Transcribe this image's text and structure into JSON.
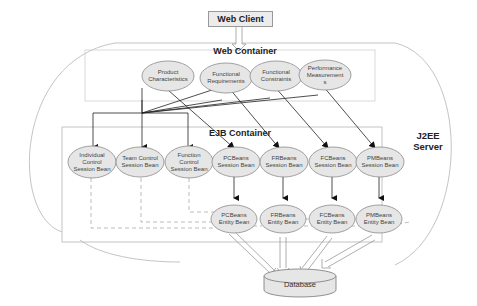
{
  "diagram": {
    "web_client": "Web Client",
    "j2ee_server": {
      "line1": "J2EE",
      "line2": "Server"
    },
    "web_container": {
      "title": "Web Container",
      "nodes": [
        {
          "line1": "Product",
          "line2": "Characteristics",
          "line3": ""
        },
        {
          "line1": "Functional",
          "line2": "Requirements",
          "line3": ""
        },
        {
          "line1": "Functional",
          "line2": "Constraints",
          "line3": ""
        },
        {
          "line1": "Performance",
          "line2": "Measurement",
          "line3": "s"
        }
      ]
    },
    "ejb_container": {
      "title": "EJB Container",
      "session_beans": [
        {
          "line1": "Individual",
          "line2": "Control",
          "line3": "Session Bean"
        },
        {
          "line1": "Team Control",
          "line2": "Session Bean",
          "line3": ""
        },
        {
          "line1": "Function",
          "line2": "Control",
          "line3": "Session Bean"
        },
        {
          "line1": "PCBeans",
          "line2": "Session Bean",
          "line3": ""
        },
        {
          "line1": "FRBeans",
          "line2": "Session Bean",
          "line3": ""
        },
        {
          "line1": "FCBeans",
          "line2": "Session Bean",
          "line3": ""
        },
        {
          "line1": "PMBeans",
          "line2": "Session Bean",
          "line3": ""
        }
      ],
      "entity_beans": [
        {
          "line1": "PCBeans",
          "line2": "Entity Bean"
        },
        {
          "line1": "FRBeans",
          "line2": "Entity Bean"
        },
        {
          "line1": "FCBeans",
          "line2": "Entity Bean"
        },
        {
          "line1": "PMBeans",
          "line2": "Entity Bean"
        }
      ]
    },
    "database": "Database",
    "colors": {
      "node_fill": "#e6e6e6",
      "node_stroke": "#8a8a8a",
      "line": "#222222",
      "container_stroke": "#b5b5b5"
    }
  }
}
